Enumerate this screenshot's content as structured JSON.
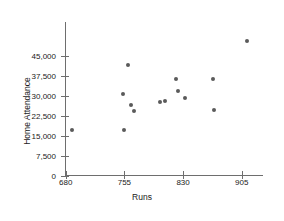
{
  "chart_data": {
    "type": "scatter",
    "title": "",
    "xlabel": "Runs",
    "ylabel": "Home Attendance",
    "xlim": [
      662,
      928
    ],
    "ylim": [
      0,
      52000
    ],
    "xticks": [
      680,
      755,
      830,
      905
    ],
    "xticklabels": [
      "680",
      "755",
      "830",
      "905"
    ],
    "yticks": [
      0,
      7500,
      15000,
      22500,
      30000,
      37500,
      45000
    ],
    "yticklabels": [
      "0",
      "7,500",
      "15,000",
      "22,500",
      "30,000",
      "37,500",
      "45,000"
    ],
    "grid": false,
    "legend": false,
    "marker_color": "#5a5a5a",
    "axis_color": "#6e6e6e",
    "points": [
      {
        "x": 688,
        "y": 17400
      },
      {
        "x": 753,
        "y": 30700
      },
      {
        "x": 755,
        "y": 17200
      },
      {
        "x": 759,
        "y": 41800
      },
      {
        "x": 763,
        "y": 26800
      },
      {
        "x": 767,
        "y": 24200
      },
      {
        "x": 800,
        "y": 27900
      },
      {
        "x": 807,
        "y": 28100
      },
      {
        "x": 821,
        "y": 36200
      },
      {
        "x": 824,
        "y": 31800
      },
      {
        "x": 833,
        "y": 29300
      },
      {
        "x": 868,
        "y": 36400
      },
      {
        "x": 870,
        "y": 24600
      },
      {
        "x": 912,
        "y": 50600
      }
    ]
  }
}
